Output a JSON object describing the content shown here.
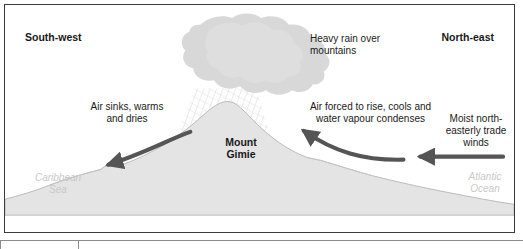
{
  "figure": {
    "type": "relief-rainfall-cross-section",
    "border_color": "#3a3a3a",
    "background_color": "#ffffff",
    "terrain_color": "#e4e4e4",
    "cloud_color": "#d8d8d8",
    "arrow_color": "#555555",
    "sea_label_color": "#c9c9c9",
    "text_color": "#1a1a1a"
  },
  "direction_labels": {
    "left": "South-west",
    "right": "North-east"
  },
  "annotations": {
    "leeward": "Air sinks, warms\nand dries",
    "cloud": "Heavy rain over\nmountains",
    "windward": "Air forced to rise, cools and\nwater vapour condenses",
    "trade_winds": "Moist north-\neasterly trade\nwinds"
  },
  "peak": {
    "name": "Mount\nGimie"
  },
  "water_bodies": {
    "left": "Caribbean\nSea",
    "right": "Atlantic\nOcean"
  },
  "arrows": [
    {
      "name": "descending-air-arrow",
      "direction": "down-left",
      "style": "curved",
      "description": "Air sinking down the leeward slope"
    },
    {
      "name": "ascending-air-arrow",
      "direction": "up-left",
      "style": "curved",
      "description": "Air forced to rise up the windward slope"
    },
    {
      "name": "trade-wind-arrow",
      "direction": "left",
      "style": "straight",
      "description": "Moist north-easterly trade winds blowing inland"
    }
  ],
  "rain": {
    "name": "rain-hatching",
    "description": "Diagonal hatched shading beneath the cloud indicating heavy rainfall"
  }
}
